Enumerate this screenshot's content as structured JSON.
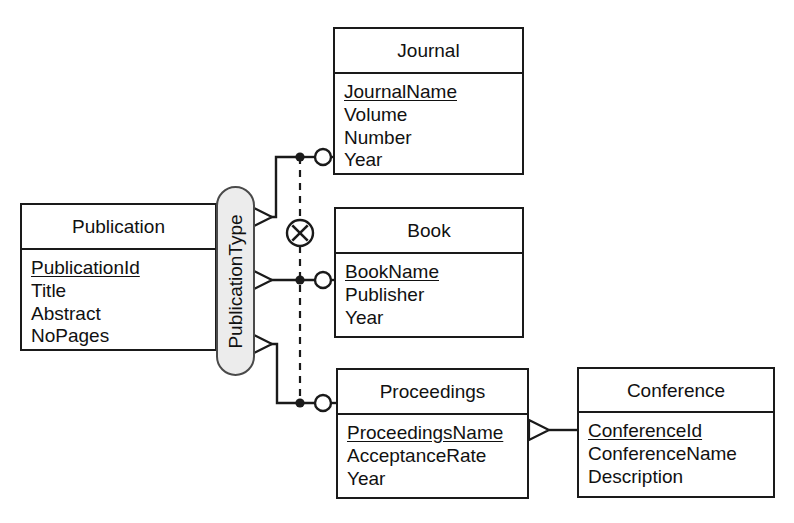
{
  "diagram": {
    "notation": "Barker/UML-style ER with exclusive-or (XOR) subtype constraint",
    "colors": {
      "line": "#1a1a1a",
      "capsule_fill": "#ececec",
      "capsule_border": "#4a4a4a",
      "text": "#111111",
      "background": "#ffffff"
    }
  },
  "entities": {
    "publication": {
      "name": "Publication",
      "attributes": [
        {
          "label": "PublicationId",
          "key": true
        },
        {
          "label": "Title",
          "key": false
        },
        {
          "label": "Abstract",
          "key": false
        },
        {
          "label": "NoPages",
          "key": false
        }
      ]
    },
    "journal": {
      "name": "Journal",
      "attributes": [
        {
          "label": "JournalName",
          "key": true
        },
        {
          "label": "Volume",
          "key": false
        },
        {
          "label": "Number",
          "key": false
        },
        {
          "label": "Year",
          "key": false
        }
      ]
    },
    "book": {
      "name": "Book",
      "attributes": [
        {
          "label": "BookName",
          "key": true
        },
        {
          "label": "Publisher",
          "key": false
        },
        {
          "label": "Year",
          "key": false
        }
      ]
    },
    "proceedings": {
      "name": "Proceedings",
      "attributes": [
        {
          "label": "ProceedingsName",
          "key": true
        },
        {
          "label": "AcceptanceRate",
          "key": false
        },
        {
          "label": "Year",
          "key": false
        }
      ]
    },
    "conference": {
      "name": "Conference",
      "attributes": [
        {
          "label": "ConferenceId",
          "key": true
        },
        {
          "label": "ConferenceName",
          "key": false
        },
        {
          "label": "Description",
          "key": false
        }
      ]
    }
  },
  "discriminator": {
    "label": "PublicationType"
  },
  "constraint": {
    "symbol": "xor-circle-icon",
    "meaning": "exclusive or"
  },
  "relationships": [
    {
      "from": "PublicationType",
      "to": "Journal",
      "from_marker": "crowsfoot-arrow",
      "to_marker": "optional-circle"
    },
    {
      "from": "PublicationType",
      "to": "Book",
      "from_marker": "crowsfoot-arrow",
      "to_marker": "optional-circle"
    },
    {
      "from": "PublicationType",
      "to": "Proceedings",
      "from_marker": "crowsfoot-arrow",
      "to_marker": "optional-circle"
    },
    {
      "from": "Proceedings",
      "to": "Conference",
      "from_marker": "crowsfoot-arrow",
      "to_marker": "plain"
    }
  ]
}
